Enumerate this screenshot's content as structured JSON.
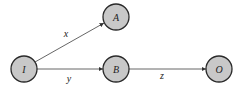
{
  "diagram": {
    "type": "directed-graph",
    "colors": {
      "node_fill": "#c8c8c8",
      "node_stroke": "#2a2a2a",
      "edge": "#555555",
      "text": "#222222"
    },
    "nodes": [
      {
        "id": "I",
        "label": "I",
        "cx": 24,
        "cy": 69,
        "r": 13
      },
      {
        "id": "A",
        "label": "A",
        "cx": 116,
        "cy": 17,
        "r": 13
      },
      {
        "id": "B",
        "label": "B",
        "cx": 116,
        "cy": 69,
        "r": 13
      },
      {
        "id": "O",
        "label": "O",
        "cx": 219,
        "cy": 69,
        "r": 13
      }
    ],
    "edges": [
      {
        "from": "I",
        "to": "A",
        "label": "x"
      },
      {
        "from": "I",
        "to": "B",
        "label": "y"
      },
      {
        "from": "B",
        "to": "O",
        "label": "z"
      }
    ]
  }
}
